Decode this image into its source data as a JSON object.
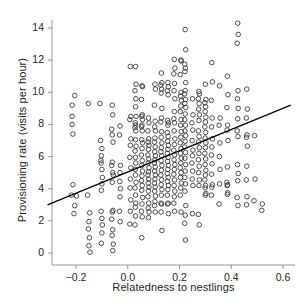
{
  "chart_data": {
    "type": "scatter",
    "title": "",
    "xlabel": "Relatedness to nestlings",
    "ylabel": "Provisioning rate (visits per hour)",
    "xlim": [
      -0.31,
      0.63
    ],
    "ylim": [
      -0.45,
      14.9
    ],
    "xticks": [
      -0.2,
      0.0,
      0.2,
      0.4,
      0.6
    ],
    "xticklabels": [
      "−0.2",
      "0.0",
      "0.2",
      "0.4",
      "0.6"
    ],
    "yticks": [
      0,
      2,
      4,
      6,
      8,
      10,
      12,
      14
    ],
    "yticklabels": [
      "0",
      "2",
      "4",
      "6",
      "8",
      "10",
      "12",
      "14"
    ],
    "grid": false,
    "legend": null,
    "marker": {
      "shape": "open-circle",
      "radius_px": 2.3,
      "stroke": "#3a3a3a",
      "fill": "none",
      "stroke_width": 0.9
    },
    "trendline": {
      "type": "linear-fit",
      "x": [
        -0.31,
        0.63
      ],
      "y": [
        3.0,
        9.2
      ],
      "slope": 6.6,
      "intercept": 5.05,
      "color": "#000000",
      "width": 1.3
    },
    "axis_color": "#8d8d8d",
    "n_points": 352,
    "points": [
      [
        -0.205,
        9.8
      ],
      [
        -0.215,
        9.2
      ],
      [
        -0.215,
        8.5
      ],
      [
        -0.215,
        8.0
      ],
      [
        -0.212,
        7.4
      ],
      [
        -0.212,
        4.25
      ],
      [
        -0.218,
        3.6
      ],
      [
        -0.198,
        3.55
      ],
      [
        -0.205,
        2.95
      ],
      [
        -0.208,
        2.45
      ],
      [
        -0.152,
        9.3
      ],
      [
        -0.155,
        3.6
      ],
      [
        -0.147,
        2.5
      ],
      [
        -0.15,
        1.95
      ],
      [
        -0.152,
        1.5
      ],
      [
        -0.148,
        0.95
      ],
      [
        -0.15,
        0.45
      ],
      [
        -0.146,
        0.05
      ],
      [
        -0.108,
        9.3
      ],
      [
        -0.105,
        7.0
      ],
      [
        -0.1,
        6.5
      ],
      [
        -0.102,
        6.05
      ],
      [
        -0.104,
        5.75
      ],
      [
        -0.103,
        5.6
      ],
      [
        -0.1,
        5.2
      ],
      [
        -0.098,
        4.7
      ],
      [
        -0.1,
        4.3
      ],
      [
        -0.102,
        3.9
      ],
      [
        -0.103,
        2.6
      ],
      [
        -0.1,
        2.15
      ],
      [
        -0.098,
        1.75
      ],
      [
        -0.1,
        1.25
      ],
      [
        -0.102,
        0.6
      ],
      [
        -0.06,
        9.2
      ],
      [
        -0.058,
        8.6
      ],
      [
        -0.062,
        7.7
      ],
      [
        -0.06,
        7.35
      ],
      [
        -0.057,
        6.9
      ],
      [
        -0.06,
        5.65
      ],
      [
        -0.062,
        5.45
      ],
      [
        -0.058,
        5.0
      ],
      [
        -0.056,
        4.85
      ],
      [
        -0.06,
        4.4
      ],
      [
        -0.057,
        2.65
      ],
      [
        -0.06,
        2.55
      ],
      [
        -0.062,
        2.1
      ],
      [
        -0.058,
        1.45
      ],
      [
        -0.06,
        1.1
      ],
      [
        -0.056,
        0.55
      ],
      [
        -0.058,
        0.15
      ],
      [
        -0.03,
        7.9
      ],
      [
        -0.032,
        7.35
      ],
      [
        -0.028,
        5.45
      ],
      [
        -0.03,
        5.0
      ],
      [
        -0.031,
        4.45
      ],
      [
        -0.028,
        4.0
      ],
      [
        -0.03,
        3.5
      ],
      [
        -0.032,
        2.6
      ],
      [
        -0.029,
        1.95
      ],
      [
        0.01,
        11.6
      ],
      [
        0.012,
        8.5
      ],
      [
        0.008,
        8.3
      ],
      [
        0.012,
        7.1
      ],
      [
        0.01,
        6.7
      ],
      [
        0.008,
        5.95
      ],
      [
        0.012,
        5.3
      ],
      [
        0.01,
        4.6
      ],
      [
        0.009,
        4.05
      ],
      [
        0.012,
        3.3
      ],
      [
        0.01,
        2.6
      ],
      [
        0.008,
        1.8
      ],
      [
        0.03,
        11.6
      ],
      [
        0.032,
        10.5
      ],
      [
        0.028,
        10.1
      ],
      [
        0.031,
        9.6
      ],
      [
        0.03,
        9.1
      ],
      [
        0.032,
        8.5
      ],
      [
        0.029,
        8.1
      ],
      [
        0.03,
        7.95
      ],
      [
        0.028,
        7.8
      ],
      [
        0.031,
        7.6
      ],
      [
        0.03,
        7.05
      ],
      [
        0.032,
        6.65
      ],
      [
        0.028,
        6.35
      ],
      [
        0.03,
        5.95
      ],
      [
        0.031,
        5.6
      ],
      [
        0.029,
        5.2
      ],
      [
        0.03,
        4.85
      ],
      [
        0.032,
        4.4
      ],
      [
        0.028,
        4.05
      ],
      [
        0.03,
        3.6
      ],
      [
        0.031,
        3.1
      ],
      [
        0.029,
        2.85
      ],
      [
        0.03,
        2.3
      ],
      [
        0.028,
        1.75
      ],
      [
        0.055,
        10.4
      ],
      [
        0.057,
        10.35
      ],
      [
        0.053,
        9.55
      ],
      [
        0.056,
        8.6
      ],
      [
        0.054,
        8.5
      ],
      [
        0.057,
        8.3
      ],
      [
        0.055,
        7.95
      ],
      [
        0.053,
        7.85
      ],
      [
        0.056,
        7.6
      ],
      [
        0.054,
        7.05
      ],
      [
        0.057,
        6.85
      ],
      [
        0.055,
        6.5
      ],
      [
        0.053,
        6.1
      ],
      [
        0.056,
        5.75
      ],
      [
        0.054,
        5.45
      ],
      [
        0.057,
        5.1
      ],
      [
        0.055,
        4.8
      ],
      [
        0.053,
        4.5
      ],
      [
        0.056,
        4.2
      ],
      [
        0.054,
        3.9
      ],
      [
        0.057,
        3.45
      ],
      [
        0.055,
        3.05
      ],
      [
        0.053,
        2.6
      ],
      [
        0.056,
        2.25
      ],
      [
        0.054,
        0.95
      ],
      [
        0.08,
        8.4
      ],
      [
        0.082,
        8.1
      ],
      [
        0.078,
        7.6
      ],
      [
        0.081,
        7.1
      ],
      [
        0.079,
        6.9
      ],
      [
        0.082,
        6.7
      ],
      [
        0.08,
        6.45
      ],
      [
        0.078,
        6.1
      ],
      [
        0.081,
        5.85
      ],
      [
        0.079,
        5.6
      ],
      [
        0.082,
        5.3
      ],
      [
        0.08,
        5.05
      ],
      [
        0.078,
        4.85
      ],
      [
        0.081,
        4.6
      ],
      [
        0.079,
        4.35
      ],
      [
        0.082,
        4.1
      ],
      [
        0.08,
        3.85
      ],
      [
        0.078,
        3.5
      ],
      [
        0.081,
        3.1
      ],
      [
        0.079,
        2.8
      ],
      [
        0.082,
        2.55
      ],
      [
        0.08,
        2.2
      ],
      [
        0.105,
        10.5
      ],
      [
        0.107,
        10.2
      ],
      [
        0.103,
        9.2
      ],
      [
        0.106,
        8.2
      ],
      [
        0.104,
        7.85
      ],
      [
        0.107,
        7.6
      ],
      [
        0.105,
        7.15
      ],
      [
        0.103,
        6.9
      ],
      [
        0.106,
        6.6
      ],
      [
        0.104,
        6.3
      ],
      [
        0.107,
        6.05
      ],
      [
        0.105,
        5.8
      ],
      [
        0.103,
        5.6
      ],
      [
        0.106,
        5.35
      ],
      [
        0.104,
        5.1
      ],
      [
        0.107,
        4.85
      ],
      [
        0.105,
        4.6
      ],
      [
        0.103,
        4.35
      ],
      [
        0.106,
        4.1
      ],
      [
        0.104,
        3.85
      ],
      [
        0.107,
        3.55
      ],
      [
        0.105,
        3.2
      ],
      [
        0.103,
        2.95
      ],
      [
        0.106,
        2.55
      ],
      [
        0.13,
        11.2
      ],
      [
        0.132,
        10.6
      ],
      [
        0.128,
        10.45
      ],
      [
        0.131,
        10.2
      ],
      [
        0.129,
        9.95
      ],
      [
        0.132,
        9.0
      ],
      [
        0.13,
        8.4
      ],
      [
        0.128,
        8.15
      ],
      [
        0.131,
        7.55
      ],
      [
        0.129,
        7.2
      ],
      [
        0.132,
        6.85
      ],
      [
        0.13,
        6.55
      ],
      [
        0.128,
        6.3
      ],
      [
        0.131,
        6.05
      ],
      [
        0.129,
        5.75
      ],
      [
        0.132,
        5.45
      ],
      [
        0.13,
        5.15
      ],
      [
        0.128,
        4.85
      ],
      [
        0.131,
        4.55
      ],
      [
        0.129,
        4.25
      ],
      [
        0.132,
        3.95
      ],
      [
        0.13,
        3.6
      ],
      [
        0.128,
        3.1
      ],
      [
        0.131,
        3.05
      ],
      [
        0.129,
        2.55
      ],
      [
        0.132,
        1.4
      ],
      [
        0.155,
        10.6
      ],
      [
        0.157,
        10.35
      ],
      [
        0.153,
        10.1
      ],
      [
        0.156,
        9.85
      ],
      [
        0.154,
        8.25
      ],
      [
        0.157,
        8.1
      ],
      [
        0.155,
        7.95
      ],
      [
        0.153,
        7.5
      ],
      [
        0.156,
        7.25
      ],
      [
        0.154,
        6.95
      ],
      [
        0.157,
        6.7
      ],
      [
        0.155,
        6.45
      ],
      [
        0.153,
        6.2
      ],
      [
        0.156,
        5.95
      ],
      [
        0.154,
        5.7
      ],
      [
        0.157,
        5.45
      ],
      [
        0.155,
        5.2
      ],
      [
        0.153,
        4.95
      ],
      [
        0.156,
        4.7
      ],
      [
        0.154,
        4.45
      ],
      [
        0.157,
        4.2
      ],
      [
        0.155,
        3.95
      ],
      [
        0.153,
        3.6
      ],
      [
        0.156,
        3.1
      ],
      [
        0.154,
        3.05
      ],
      [
        0.157,
        2.45
      ],
      [
        0.18,
        12.05
      ],
      [
        0.182,
        11.5
      ],
      [
        0.178,
        11.15
      ],
      [
        0.181,
        10.55
      ],
      [
        0.179,
        10.1
      ],
      [
        0.182,
        9.6
      ],
      [
        0.18,
        8.8
      ],
      [
        0.178,
        8.35
      ],
      [
        0.181,
        8.1
      ],
      [
        0.179,
        7.6
      ],
      [
        0.182,
        7.1
      ],
      [
        0.18,
        6.75
      ],
      [
        0.178,
        6.4
      ],
      [
        0.181,
        6.1
      ],
      [
        0.179,
        5.8
      ],
      [
        0.182,
        5.5
      ],
      [
        0.18,
        5.2
      ],
      [
        0.178,
        4.9
      ],
      [
        0.181,
        4.55
      ],
      [
        0.179,
        4.2
      ],
      [
        0.182,
        3.85
      ],
      [
        0.18,
        3.5
      ],
      [
        0.178,
        3.1
      ],
      [
        0.181,
        2.6
      ],
      [
        0.205,
        12.0
      ],
      [
        0.207,
        11.95
      ],
      [
        0.203,
        11.1
      ],
      [
        0.206,
        10.0
      ],
      [
        0.204,
        9.75
      ],
      [
        0.207,
        9.5
      ],
      [
        0.205,
        9.15
      ],
      [
        0.203,
        8.8
      ],
      [
        0.206,
        8.3
      ],
      [
        0.204,
        7.95
      ],
      [
        0.207,
        7.55
      ],
      [
        0.205,
        7.2
      ],
      [
        0.203,
        6.85
      ],
      [
        0.206,
        6.5
      ],
      [
        0.204,
        6.2
      ],
      [
        0.207,
        5.9
      ],
      [
        0.205,
        5.6
      ],
      [
        0.203,
        5.3
      ],
      [
        0.206,
        5.0
      ],
      [
        0.204,
        4.7
      ],
      [
        0.207,
        4.35
      ],
      [
        0.205,
        4.05
      ],
      [
        0.203,
        3.6
      ],
      [
        0.206,
        2.55
      ],
      [
        0.222,
        13.9
      ],
      [
        0.224,
        12.65
      ],
      [
        0.22,
        11.75
      ],
      [
        0.223,
        11.5
      ],
      [
        0.221,
        11.3
      ],
      [
        0.224,
        10.6
      ],
      [
        0.222,
        10.1
      ],
      [
        0.22,
        9.9
      ],
      [
        0.223,
        9.55
      ],
      [
        0.221,
        9.3
      ],
      [
        0.224,
        9.05
      ],
      [
        0.222,
        8.65
      ],
      [
        0.22,
        8.3
      ],
      [
        0.223,
        7.95
      ],
      [
        0.221,
        7.6
      ],
      [
        0.224,
        7.3
      ],
      [
        0.222,
        6.95
      ],
      [
        0.22,
        6.6
      ],
      [
        0.223,
        6.25
      ],
      [
        0.221,
        5.9
      ],
      [
        0.224,
        5.5
      ],
      [
        0.222,
        5.1
      ],
      [
        0.22,
        4.7
      ],
      [
        0.223,
        4.3
      ],
      [
        0.221,
        3.85
      ],
      [
        0.224,
        2.95
      ],
      [
        0.222,
        2.35
      ],
      [
        0.22,
        1.85
      ],
      [
        0.223,
        0.8
      ],
      [
        0.25,
        9.6
      ],
      [
        0.252,
        8.6
      ],
      [
        0.248,
        8.1
      ],
      [
        0.251,
        7.65
      ],
      [
        0.249,
        7.0
      ],
      [
        0.252,
        6.4
      ],
      [
        0.25,
        6.05
      ],
      [
        0.248,
        5.6
      ],
      [
        0.251,
        5.1
      ],
      [
        0.249,
        4.6
      ],
      [
        0.252,
        4.2
      ],
      [
        0.25,
        2.45
      ],
      [
        0.275,
        10.05
      ],
      [
        0.277,
        9.9
      ],
      [
        0.273,
        9.6
      ],
      [
        0.276,
        9.3
      ],
      [
        0.274,
        8.95
      ],
      [
        0.277,
        8.6
      ],
      [
        0.275,
        8.25
      ],
      [
        0.273,
        7.6
      ],
      [
        0.276,
        7.25
      ],
      [
        0.274,
        6.9
      ],
      [
        0.277,
        6.55
      ],
      [
        0.275,
        6.2
      ],
      [
        0.273,
        5.8
      ],
      [
        0.276,
        5.4
      ],
      [
        0.274,
        5.0
      ],
      [
        0.277,
        4.55
      ],
      [
        0.275,
        4.2
      ],
      [
        0.273,
        2.4
      ],
      [
        0.276,
        1.75
      ],
      [
        0.3,
        10.5
      ],
      [
        0.302,
        9.55
      ],
      [
        0.298,
        9.35
      ],
      [
        0.301,
        9.1
      ],
      [
        0.299,
        8.8
      ],
      [
        0.302,
        8.45
      ],
      [
        0.3,
        8.15
      ],
      [
        0.298,
        7.85
      ],
      [
        0.301,
        7.5
      ],
      [
        0.299,
        7.15
      ],
      [
        0.302,
        6.85
      ],
      [
        0.3,
        6.55
      ],
      [
        0.298,
        6.2
      ],
      [
        0.301,
        5.85
      ],
      [
        0.299,
        5.5
      ],
      [
        0.302,
        5.15
      ],
      [
        0.3,
        4.85
      ],
      [
        0.298,
        4.55
      ],
      [
        0.301,
        4.2
      ],
      [
        0.299,
        4.05
      ],
      [
        0.302,
        3.7
      ],
      [
        0.3,
        3.6
      ],
      [
        0.325,
        11.85
      ],
      [
        0.327,
        10.65
      ],
      [
        0.323,
        9.5
      ],
      [
        0.326,
        8.4
      ],
      [
        0.324,
        7.85
      ],
      [
        0.327,
        7.1
      ],
      [
        0.325,
        6.6
      ],
      [
        0.323,
        6.1
      ],
      [
        0.326,
        5.55
      ],
      [
        0.324,
        4.9
      ],
      [
        0.327,
        4.25
      ],
      [
        0.325,
        4.1
      ],
      [
        0.323,
        3.6
      ],
      [
        0.355,
        10.4
      ],
      [
        0.357,
        8.4
      ],
      [
        0.353,
        7.95
      ],
      [
        0.356,
        6.85
      ],
      [
        0.354,
        6.0
      ],
      [
        0.357,
        5.2
      ],
      [
        0.355,
        4.3
      ],
      [
        0.353,
        3.05
      ],
      [
        0.385,
        11.0
      ],
      [
        0.387,
        9.85
      ],
      [
        0.383,
        9.05
      ],
      [
        0.386,
        7.95
      ],
      [
        0.384,
        7.65
      ],
      [
        0.387,
        7.0
      ],
      [
        0.385,
        5.35
      ],
      [
        0.383,
        4.4
      ],
      [
        0.386,
        4.25
      ],
      [
        0.384,
        4.2
      ],
      [
        0.387,
        3.75
      ],
      [
        0.385,
        3.65
      ],
      [
        0.425,
        14.3
      ],
      [
        0.427,
        13.6
      ],
      [
        0.423,
        13.05
      ],
      [
        0.426,
        10.1
      ],
      [
        0.424,
        9.6
      ],
      [
        0.427,
        9.0
      ],
      [
        0.425,
        8.35
      ],
      [
        0.423,
        7.6
      ],
      [
        0.426,
        7.25
      ],
      [
        0.424,
        5.5
      ],
      [
        0.427,
        4.95
      ],
      [
        0.425,
        4.5
      ],
      [
        0.423,
        3.45
      ],
      [
        0.426,
        2.95
      ],
      [
        0.46,
        10.2
      ],
      [
        0.462,
        8.95
      ],
      [
        0.458,
        8.4
      ],
      [
        0.461,
        7.35
      ],
      [
        0.459,
        7.2
      ],
      [
        0.462,
        6.65
      ],
      [
        0.46,
        5.4
      ],
      [
        0.458,
        4.55
      ],
      [
        0.461,
        3.5
      ],
      [
        0.459,
        3.0
      ],
      [
        0.49,
        7.3
      ],
      [
        0.492,
        4.6
      ],
      [
        0.488,
        3.25
      ],
      [
        0.52,
        3.05
      ],
      [
        0.518,
        2.65
      ]
    ]
  }
}
